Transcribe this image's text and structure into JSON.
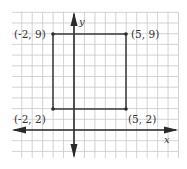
{
  "diagram": {
    "type": "coordinate-plane",
    "axes": {
      "x_label": "x",
      "y_label": "y"
    },
    "grid": {
      "x_min": -6,
      "x_max": 10,
      "y_min": -3,
      "y_max": 11
    },
    "shape": "rectangle",
    "points": [
      {
        "label": "(-2, 9)",
        "x": -2,
        "y": 9
      },
      {
        "label": "(5, 9)",
        "x": 5,
        "y": 9
      },
      {
        "label": "(5, 2)",
        "x": 5,
        "y": 2
      },
      {
        "label": "(-2, 2)",
        "x": -2,
        "y": 2
      }
    ]
  },
  "colors": {
    "grid": "#c8c8c8",
    "axis": "#2a2a2a",
    "shape": "#3a3a3a",
    "text": "#333333"
  }
}
